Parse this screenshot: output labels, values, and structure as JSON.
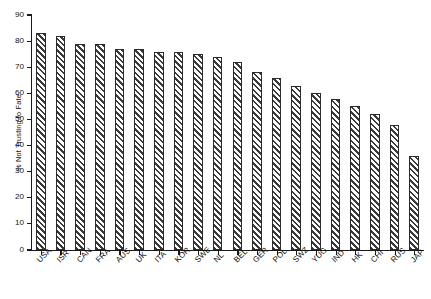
{
  "chart_data": {
    "type": "bar",
    "title": "",
    "subtitle": "",
    "xlabel": "",
    "ylabel": "% Not Trusting to Fate",
    "ylim": [
      0,
      90
    ],
    "ytick_step": 10,
    "yticks": [
      0,
      10,
      20,
      30,
      40,
      50,
      60,
      70,
      80,
      90
    ],
    "grid": false,
    "legend": false,
    "legend_position": "none",
    "categories": [
      "USA",
      "ISR",
      "CAN",
      "FRA",
      "AUS",
      "UK",
      "ITA",
      "KOR",
      "SWE",
      "NL",
      "BEL",
      "GER",
      "POL",
      "SWZ",
      "YUG",
      "IND",
      "HK",
      "CHI",
      "RUS",
      "JAP"
    ],
    "values": [
      83,
      82,
      79,
      79,
      77,
      77,
      76,
      76,
      75,
      74,
      72,
      68,
      66,
      63,
      60,
      58,
      55,
      52,
      48,
      36
    ],
    "series": [
      {
        "name": "% Not Trusting to Fate",
        "values": [
          83,
          82,
          79,
          79,
          77,
          77,
          76,
          76,
          75,
          74,
          72,
          68,
          66,
          63,
          60,
          58,
          55,
          52,
          48,
          36
        ]
      }
    ],
    "bar_style": {
      "fill": "#ffffff",
      "hatch": "diagonal-45",
      "hatch_color": "#3a3a3a",
      "edge_color": "#2b2b2b"
    },
    "annotations": []
  },
  "axes": {
    "y_title": "% Not Trusting to Fate",
    "y_tick_labels": [
      "90",
      "80",
      "70",
      "60",
      "50",
      "40",
      "30",
      "20",
      "10",
      "0"
    ]
  }
}
